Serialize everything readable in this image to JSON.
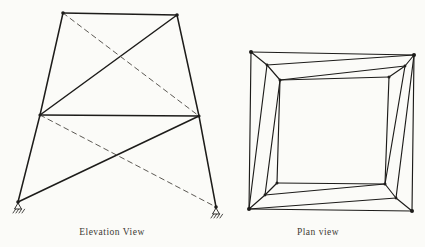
{
  "palette": {
    "background": "#fbfbf8",
    "line": "#1d1c1a",
    "dashed_line": "#4a4641",
    "text": "#3d3a35"
  },
  "figures": [
    {
      "name": "elevation-view-figure",
      "caption": "Elevation View",
      "stroke_width": 1.5,
      "dashed_stroke_width": 0.9,
      "dash_pattern": "5 4",
      "nodes": {
        "TL": [
          63,
          13
        ],
        "TR": [
          177,
          15
        ],
        "ML": [
          40,
          115
        ],
        "MR": [
          199,
          116
        ],
        "BL": [
          18,
          202
        ],
        "BR": [
          216,
          207
        ]
      },
      "dots": [
        [
          "TL",
          1.8
        ],
        [
          "TR",
          1.8
        ],
        [
          "ML",
          1.6
        ],
        [
          "MR",
          1.6
        ],
        [
          "BL",
          1.8
        ],
        [
          "BR",
          1.8
        ]
      ],
      "members": [
        {
          "from": "TL",
          "to": "TR",
          "style": "solid"
        },
        {
          "from": "TL",
          "to": "ML",
          "style": "solid"
        },
        {
          "from": "ML",
          "to": "BL",
          "style": "solid"
        },
        {
          "from": "TR",
          "to": "MR",
          "style": "solid"
        },
        {
          "from": "MR",
          "to": "BR",
          "style": "solid"
        },
        {
          "from": "ML",
          "to": "MR",
          "style": "solid"
        },
        {
          "from": "ML",
          "to": "TR",
          "style": "solid"
        },
        {
          "from": "BL",
          "to": "MR",
          "style": "solid"
        },
        {
          "from": "TL",
          "to": "MR",
          "style": "dashed"
        },
        {
          "from": "ML",
          "to": "BR",
          "style": "dashed"
        }
      ],
      "supports": [
        "BL",
        "BR"
      ]
    },
    {
      "name": "plan-view-figure",
      "caption": "Plan view",
      "stroke_width": 1.15,
      "dashed_stroke_width": 0.9,
      "dash_pattern": "5 4",
      "nodes": {
        "O1": [
          251,
          52
        ],
        "O2": [
          414,
          55
        ],
        "O3": [
          412,
          211
        ],
        "O4": [
          249,
          209
        ],
        "M1": [
          267,
          65
        ],
        "M2": [
          405,
          66
        ],
        "M3": [
          396,
          198
        ],
        "M4": [
          265,
          195
        ],
        "I1": [
          280,
          80
        ],
        "I2": [
          389,
          77
        ],
        "I3": [
          385,
          184
        ],
        "I4": [
          277,
          183
        ]
      },
      "dots": [
        [
          "O1",
          2.0
        ],
        [
          "O2",
          2.0
        ],
        [
          "O3",
          2.0
        ],
        [
          "O4",
          2.0
        ],
        [
          "M1",
          1.4
        ],
        [
          "M2",
          1.4
        ],
        [
          "M3",
          1.4
        ],
        [
          "M4",
          1.4
        ],
        [
          "I1",
          1.5
        ],
        [
          "I2",
          1.5
        ],
        [
          "I3",
          1.5
        ],
        [
          "I4",
          1.5
        ]
      ],
      "members": [
        {
          "from": "O1",
          "to": "O2",
          "style": "solid"
        },
        {
          "from": "O2",
          "to": "O3",
          "style": "solid"
        },
        {
          "from": "O3",
          "to": "O4",
          "style": "solid"
        },
        {
          "from": "O4",
          "to": "O1",
          "style": "solid"
        },
        {
          "from": "I1",
          "to": "I2",
          "style": "solid"
        },
        {
          "from": "I2",
          "to": "I3",
          "style": "solid"
        },
        {
          "from": "I3",
          "to": "I4",
          "style": "solid"
        },
        {
          "from": "I4",
          "to": "I1",
          "style": "solid"
        },
        {
          "from": "O1",
          "to": "M1",
          "style": "solid"
        },
        {
          "from": "M1",
          "to": "I1",
          "style": "solid"
        },
        {
          "from": "O2",
          "to": "M2",
          "style": "solid"
        },
        {
          "from": "M2",
          "to": "I2",
          "style": "solid"
        },
        {
          "from": "O3",
          "to": "M3",
          "style": "solid"
        },
        {
          "from": "M3",
          "to": "I3",
          "style": "solid"
        },
        {
          "from": "O4",
          "to": "M4",
          "style": "solid"
        },
        {
          "from": "M4",
          "to": "I4",
          "style": "solid"
        },
        {
          "from": "O2",
          "to": "M1",
          "style": "solid"
        },
        {
          "from": "M2",
          "to": "I1",
          "style": "solid"
        },
        {
          "from": "O4",
          "to": "M1",
          "style": "solid"
        },
        {
          "from": "M4",
          "to": "I1",
          "style": "solid"
        },
        {
          "from": "O2",
          "to": "M3",
          "style": "solid"
        },
        {
          "from": "M2",
          "to": "I3",
          "style": "solid"
        },
        {
          "from": "O4",
          "to": "M3",
          "style": "solid"
        },
        {
          "from": "M4",
          "to": "I3",
          "style": "solid"
        }
      ],
      "supports": []
    }
  ]
}
